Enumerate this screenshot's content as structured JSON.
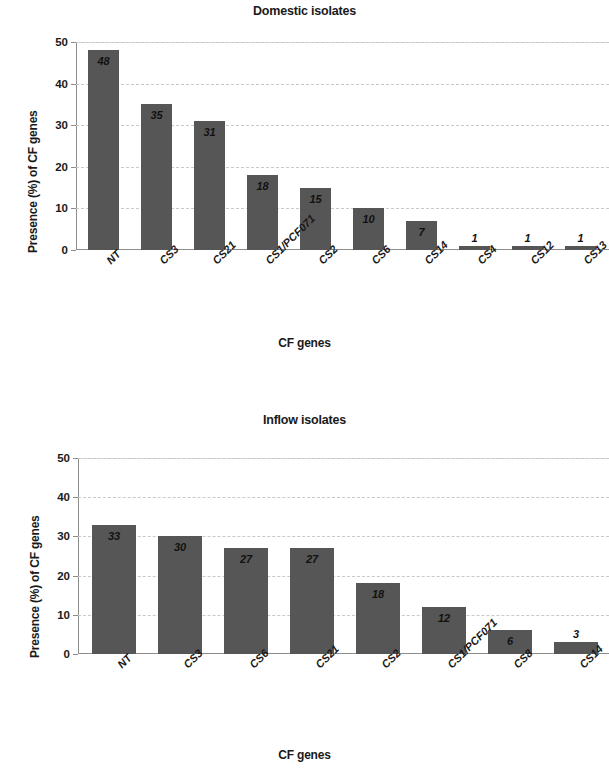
{
  "chart_data": [
    {
      "type": "bar",
      "title": "Domestic isolates",
      "xlabel": "CF genes",
      "ylabel": "Presence (%) of CF genes",
      "ylim": [
        0,
        50
      ],
      "yticks": [
        "0",
        "10",
        "20",
        "30",
        "40",
        "50"
      ],
      "grid": true,
      "legend": "none",
      "bar_color": "#565656",
      "categories": [
        "NT",
        "CS3",
        "CS21",
        "CS1/PCF071",
        "CS2",
        "CS6",
        "CS14",
        "CS4",
        "CS12",
        "CS13"
      ],
      "values": [
        48,
        35,
        31,
        18,
        15,
        10,
        7,
        1,
        1,
        1
      ],
      "value_labels": [
        "48",
        "35",
        "31",
        "18",
        "15",
        "10",
        "7",
        "1",
        "1",
        "1"
      ]
    },
    {
      "type": "bar",
      "title": "Inflow isolates",
      "xlabel": "CF genes",
      "ylabel": "Presence (%) of CF genes",
      "ylim": [
        0,
        50
      ],
      "yticks": [
        "0",
        "10",
        "20",
        "30",
        "40",
        "50"
      ],
      "grid": true,
      "legend": "none",
      "bar_color": "#565656",
      "categories": [
        "NT",
        "CS3",
        "CS6",
        "CS21",
        "CS2",
        "CS1/PCF071",
        "CS8",
        "CS14"
      ],
      "values": [
        33,
        30,
        27,
        27,
        18,
        12,
        6,
        3
      ],
      "value_labels": [
        "33",
        "30",
        "27",
        "27",
        "18",
        "12",
        "6",
        "3"
      ]
    }
  ]
}
